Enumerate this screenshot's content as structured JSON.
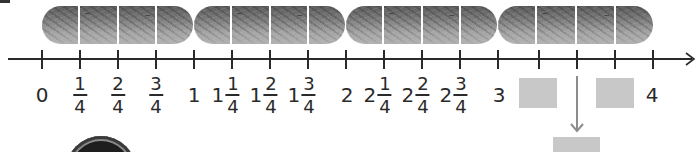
{
  "diagram": {
    "type": "fraction-number-line",
    "bars": {
      "count": 4,
      "segments_per_bar": 4,
      "fill_color": "#8a8a8a",
      "separator_color": "#ffffff"
    },
    "number_line": {
      "start": 0,
      "end": 4,
      "step": "1/4",
      "line_color": "#2a2a2a",
      "labels": [
        {
          "kind": "whole",
          "text": "0"
        },
        {
          "kind": "frac",
          "num": "1",
          "den": "4"
        },
        {
          "kind": "frac",
          "num": "2",
          "den": "4"
        },
        {
          "kind": "frac",
          "num": "3",
          "den": "4"
        },
        {
          "kind": "whole",
          "text": "1"
        },
        {
          "kind": "mixed",
          "whole": "1",
          "num": "1",
          "den": "4"
        },
        {
          "kind": "mixed",
          "whole": "1",
          "num": "2",
          "den": "4"
        },
        {
          "kind": "mixed",
          "whole": "1",
          "num": "3",
          "den": "4"
        },
        {
          "kind": "whole",
          "text": "2"
        },
        {
          "kind": "mixed",
          "whole": "2",
          "num": "1",
          "den": "4"
        },
        {
          "kind": "mixed",
          "whole": "2",
          "num": "2",
          "den": "4"
        },
        {
          "kind": "mixed",
          "whole": "2",
          "num": "3",
          "den": "4"
        },
        {
          "kind": "whole",
          "text": "3"
        },
        {
          "kind": "blank"
        },
        {
          "kind": "blank-arrow"
        },
        {
          "kind": "blank"
        },
        {
          "kind": "whole",
          "text": "4"
        }
      ]
    },
    "answer_boxes": {
      "color": "#c8c8c8",
      "count": 3
    },
    "arrow_color": "#8c8c8c"
  }
}
